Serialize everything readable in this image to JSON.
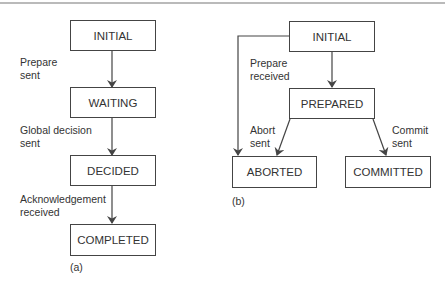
{
  "diagram_a": {
    "caption": "(a)",
    "states": [
      "INITIAL",
      "WAITING",
      "DECIDED",
      "COMPLETED"
    ],
    "transitions": [
      {
        "from": "INITIAL",
        "to": "WAITING",
        "label": "Prepare\nsent"
      },
      {
        "from": "WAITING",
        "to": "DECIDED",
        "label": "Global decision\nsent"
      },
      {
        "from": "DECIDED",
        "to": "COMPLETED",
        "label": "Acknowledgement\nreceived"
      }
    ]
  },
  "diagram_b": {
    "caption": "(b)",
    "states": [
      "INITIAL",
      "PREPARED",
      "ABORTED",
      "COMMITTED"
    ],
    "transitions": [
      {
        "from": "INITIAL",
        "to": "PREPARED",
        "label": "Prepare\nreceived"
      },
      {
        "from": "PREPARED",
        "to": "ABORTED",
        "label": "Abort\nsent"
      },
      {
        "from": "PREPARED",
        "to": "COMMITTED",
        "label": "Commit\nsent"
      },
      {
        "from": "INITIAL",
        "to": "ABORTED",
        "label": ""
      }
    ]
  },
  "colors": {
    "line": "#444444",
    "text": "#333333"
  }
}
